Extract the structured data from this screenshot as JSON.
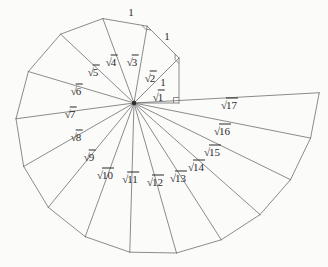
{
  "figure": {
    "name": "spiral-of-theodorus",
    "background_color": "#fbfbfa",
    "line_color": "#6e6e6e",
    "text_color": "#2b2b2b",
    "center": {
      "x": 134,
      "y": 103
    },
    "unit_length_px": 45,
    "triangle_count": 17
  },
  "chart_data": {
    "type": "diagram",
    "title": "",
    "center": {
      "x": 134,
      "y": 103
    },
    "unit_length_px": 45,
    "hypotenuses": [
      {
        "index": 1,
        "label": "1",
        "length_units": 1.0,
        "angle_deg": 0.0
      },
      {
        "index": 2,
        "label": "2",
        "length_units": 1.4142,
        "angle_deg": 45.0
      },
      {
        "index": 3,
        "label": "3",
        "length_units": 1.7321,
        "angle_deg": 80.264
      },
      {
        "index": 4,
        "label": "4",
        "length_units": 2.0,
        "angle_deg": 110.264
      },
      {
        "index": 5,
        "label": "5",
        "length_units": 2.2361,
        "angle_deg": 136.832
      },
      {
        "index": 6,
        "label": "6",
        "length_units": 2.4495,
        "angle_deg": 163.4
      },
      {
        "index": 7,
        "label": "7",
        "length_units": 2.6458,
        "angle_deg": 187.612
      },
      {
        "index": 8,
        "label": "8",
        "length_units": 2.8284,
        "angle_deg": 209.894
      },
      {
        "index": 9,
        "label": "9",
        "length_units": 3.0,
        "angle_deg": 230.599
      },
      {
        "index": 10,
        "label": "10",
        "length_units": 3.1623,
        "angle_deg": 249.948
      },
      {
        "index": 11,
        "label": "11",
        "length_units": 3.3166,
        "angle_deg": 268.383
      },
      {
        "index": 12,
        "label": "12",
        "length_units": 3.4641,
        "angle_deg": 285.818
      },
      {
        "index": 13,
        "label": "13",
        "length_units": 3.6056,
        "angle_deg": 302.53
      },
      {
        "index": 14,
        "label": "14",
        "length_units": 3.7417,
        "angle_deg": 318.482
      },
      {
        "index": 15,
        "label": "15",
        "length_units": 3.873,
        "angle_deg": 333.897
      },
      {
        "index": 16,
        "label": "16",
        "length_units": 4.0,
        "angle_deg": 348.758
      },
      {
        "index": 17,
        "label": "17",
        "length_units": 4.1231,
        "angle_deg": 363.17
      }
    ],
    "unit_edge_labels": [
      {
        "id": "unit-1",
        "text": "1",
        "x": 163,
        "y": 82
      },
      {
        "id": "unit-2",
        "text": "1",
        "x": 167,
        "y": 36
      },
      {
        "id": "unit-3",
        "text": "1",
        "x": 131,
        "y": 12
      }
    ],
    "right_angle_markers": [
      {
        "id": "right-angle-1",
        "x": 176,
        "y": 95
      },
      {
        "id": "right-angle-2",
        "x": 175,
        "y": 55
      },
      {
        "id": "right-angle-3",
        "x": 144,
        "y": 22
      }
    ]
  },
  "labels": {
    "radical_sign": "√",
    "sqrt": [
      {
        "id": "sqrt-1",
        "num": "1",
        "x": 158,
        "y": 97
      },
      {
        "id": "sqrt-2",
        "num": "2",
        "x": 150,
        "y": 78
      },
      {
        "id": "sqrt-3",
        "num": "3",
        "x": 132,
        "y": 62
      },
      {
        "id": "sqrt-4",
        "num": "4",
        "x": 111,
        "y": 62
      },
      {
        "id": "sqrt-5",
        "num": "5",
        "x": 93,
        "y": 72
      },
      {
        "id": "sqrt-6",
        "num": "6",
        "x": 76,
        "y": 91
      },
      {
        "id": "sqrt-7",
        "num": "7",
        "x": 70,
        "y": 114
      },
      {
        "id": "sqrt-8",
        "num": "8",
        "x": 76,
        "y": 137
      },
      {
        "id": "sqrt-9",
        "num": "9",
        "x": 89,
        "y": 157
      },
      {
        "id": "sqrt-10",
        "num": "10",
        "x": 105,
        "y": 175
      },
      {
        "id": "sqrt-11",
        "num": "11",
        "x": 130,
        "y": 179
      },
      {
        "id": "sqrt-12",
        "num": "12",
        "x": 155,
        "y": 182
      },
      {
        "id": "sqrt-13",
        "num": "13",
        "x": 178,
        "y": 178
      },
      {
        "id": "sqrt-14",
        "num": "14",
        "x": 196,
        "y": 167
      },
      {
        "id": "sqrt-15",
        "num": "15",
        "x": 212,
        "y": 152
      },
      {
        "id": "sqrt-16",
        "num": "16",
        "x": 222,
        "y": 131
      },
      {
        "id": "sqrt-17",
        "num": "17",
        "x": 229,
        "y": 105
      }
    ]
  }
}
